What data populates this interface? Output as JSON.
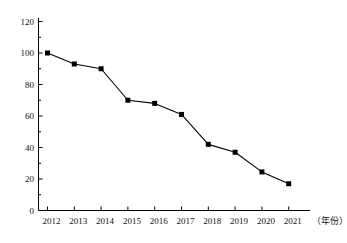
{
  "chart_data": {
    "type": "line",
    "title": "",
    "subtitle": "",
    "xlabel": "（年份）",
    "ylabel": "",
    "categories": [
      "2012",
      "2013",
      "2014",
      "2015",
      "2016",
      "2017",
      "2018",
      "2019",
      "2020",
      "2021"
    ],
    "values": [
      100,
      93,
      90,
      70,
      68,
      61,
      42,
      37,
      24.5,
      17
    ],
    "series": [
      {
        "name": "",
        "values": [
          100,
          93,
          90,
          70,
          68,
          61,
          42,
          37,
          24.5,
          17
        ]
      }
    ],
    "ylim": [
      0,
      120
    ],
    "y_ticks": [
      "0",
      "20",
      "40",
      "60",
      "80",
      "100",
      "120"
    ],
    "y_tick_values": [
      0,
      20,
      40,
      60,
      80,
      100,
      120
    ],
    "x_ticks": [
      "2012",
      "2013",
      "2014",
      "2015",
      "2016",
      "2017",
      "2018",
      "2019",
      "2020",
      "2021"
    ],
    "grid": false,
    "legend": "none",
    "marker": "square",
    "line_color": "#000000",
    "marker_color": "#000000",
    "axis_color": "#000000",
    "background_color": "#ffffff"
  },
  "axes": {
    "x_axis_name": "（年份）",
    "y_axis_name": ""
  }
}
